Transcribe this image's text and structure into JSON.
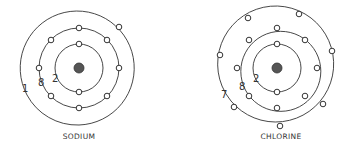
{
  "atoms": [
    {
      "name": "SODIUM",
      "center": [
        79,
        68
      ],
      "nucleus_color": "#555555",
      "shells": [
        {
          "radius": 24,
          "count_label": "2",
          "electrons": 2,
          "angles": [
            -90,
            90
          ]
        },
        {
          "radius": 40,
          "count_label": "8",
          "electrons": 8,
          "angles": [
            -90,
            -45,
            0,
            45,
            90,
            135,
            180,
            225
          ]
        },
        {
          "radius": 57,
          "count_label": "1",
          "electrons": 1,
          "angles": [
            -45
          ]
        }
      ]
    },
    {
      "name": "CHLORINE",
      "center": [
        277,
        68
      ],
      "nucleus_color": "#555555",
      "shells": [
        {
          "radius": 24,
          "count_label": "2",
          "electrons": 2,
          "angles": [
            -90,
            90
          ]
        },
        {
          "radius": 40,
          "count_label": "8",
          "electrons": 8,
          "angles": [
            -90,
            -45,
            0,
            45,
            90,
            135,
            180,
            225
          ]
        },
        {
          "radius": 58,
          "count_label": "7",
          "electrons": 7,
          "angles": [
            -120,
            -60,
            -15,
            40,
            90,
            140,
            195
          ]
        }
      ]
    }
  ]
}
